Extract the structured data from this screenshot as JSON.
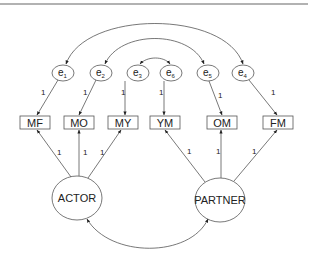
{
  "diagram": {
    "type": "structural-equation-model",
    "errors": [
      {
        "id": "e1",
        "base": "e",
        "sub": "1",
        "target": "MF",
        "loading": "1"
      },
      {
        "id": "e2",
        "base": "e",
        "sub": "2",
        "target": "MO",
        "loading": "1"
      },
      {
        "id": "e3",
        "base": "e",
        "sub": "3",
        "target": "MY",
        "loading": "1"
      },
      {
        "id": "e6",
        "base": "e",
        "sub": "6",
        "target": "YM",
        "loading": "1"
      },
      {
        "id": "e5",
        "base": "e",
        "sub": "5",
        "target": "OM",
        "loading": "1"
      },
      {
        "id": "e4",
        "base": "e",
        "sub": "4",
        "target": "FM",
        "loading": "1"
      }
    ],
    "observed": [
      "MF",
      "MO",
      "MY",
      "YM",
      "OM",
      "FM"
    ],
    "latent": {
      "actor": {
        "label": "ACTOR",
        "indicators": [
          "MF",
          "MO",
          "MY"
        ],
        "loadings": [
          "1",
          "1",
          "1"
        ]
      },
      "partner": {
        "label": "PARTNER",
        "indicators": [
          "YM",
          "OM",
          "FM"
        ],
        "loadings": [
          "1",
          "1",
          "1"
        ]
      }
    },
    "covariances": [
      {
        "from": "e1",
        "to": "e4"
      },
      {
        "from": "e2",
        "to": "e5"
      },
      {
        "from": "e3",
        "to": "e6"
      },
      {
        "from": "ACTOR",
        "to": "PARTNER"
      }
    ]
  },
  "colors": {
    "line": "#555555",
    "text": "#222222",
    "background": "#ffffff"
  }
}
